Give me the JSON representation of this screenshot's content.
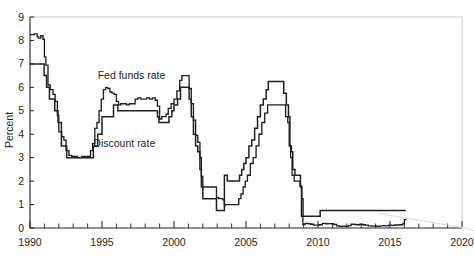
{
  "figure": {
    "background": "#ffffff",
    "ink_color": "#231f20",
    "frame_color": "#c9c9c9",
    "clipped_header_text": ""
  },
  "chart_data": {
    "type": "line",
    "title": "",
    "xlabel": "",
    "ylabel": "Percent",
    "xlim": [
      1990,
      2020
    ],
    "ylim": [
      0,
      9
    ],
    "ytick_labels": [
      "0",
      "1",
      "2",
      "3",
      "4",
      "5",
      "6",
      "7",
      "8",
      "9"
    ],
    "ytick_values": [
      0,
      1,
      2,
      3,
      4,
      5,
      6,
      7,
      8,
      9
    ],
    "xtick_labels": [
      "1990",
      "1995",
      "2000",
      "2005",
      "2010",
      "2015",
      "2020"
    ],
    "xtick_values": [
      1990,
      1995,
      2000,
      2005,
      2010,
      2015,
      2020
    ],
    "xtick_minor_step": 1,
    "grid": false,
    "legend_position": "inline-annotations",
    "annotations": [
      {
        "text": "Fed funds rate",
        "x": 1994.7,
        "y": 6.35
      },
      {
        "text": "Discount rate",
        "x": 1994.4,
        "y": 3.45
      }
    ],
    "series": [
      {
        "name": "Fed funds rate",
        "points": [
          [
            1990.0,
            8.25
          ],
          [
            1990.3,
            8.28
          ],
          [
            1990.5,
            8.15
          ],
          [
            1990.6,
            8.1
          ],
          [
            1990.75,
            8.2
          ],
          [
            1990.9,
            8.05
          ],
          [
            1991.0,
            7.3
          ],
          [
            1991.1,
            6.95
          ],
          [
            1991.25,
            6.1
          ],
          [
            1991.4,
            5.9
          ],
          [
            1991.6,
            5.7
          ],
          [
            1991.75,
            5.4
          ],
          [
            1991.9,
            4.8
          ],
          [
            1992.0,
            4.1
          ],
          [
            1992.2,
            3.9
          ],
          [
            1992.35,
            3.75
          ],
          [
            1992.5,
            3.3
          ],
          [
            1992.7,
            3.1
          ],
          [
            1992.9,
            3.05
          ],
          [
            1993.0,
            3.05
          ],
          [
            1993.3,
            3.0
          ],
          [
            1993.6,
            3.05
          ],
          [
            1993.9,
            3.0
          ],
          [
            1994.0,
            3.05
          ],
          [
            1994.2,
            3.3
          ],
          [
            1994.35,
            3.6
          ],
          [
            1994.5,
            4.25
          ],
          [
            1994.65,
            4.5
          ],
          [
            1994.8,
            5.0
          ],
          [
            1994.95,
            5.5
          ],
          [
            1995.1,
            5.9
          ],
          [
            1995.25,
            6.0
          ],
          [
            1995.4,
            5.95
          ],
          [
            1995.55,
            5.8
          ],
          [
            1995.7,
            5.75
          ],
          [
            1995.85,
            5.7
          ],
          [
            1996.0,
            5.4
          ],
          [
            1996.15,
            5.25
          ],
          [
            1996.3,
            5.3
          ],
          [
            1996.5,
            5.3
          ],
          [
            1996.7,
            5.25
          ],
          [
            1996.9,
            5.3
          ],
          [
            1997.1,
            5.3
          ],
          [
            1997.3,
            5.5
          ],
          [
            1997.5,
            5.55
          ],
          [
            1997.7,
            5.5
          ],
          [
            1997.9,
            5.5
          ],
          [
            1998.1,
            5.55
          ],
          [
            1998.3,
            5.5
          ],
          [
            1998.5,
            5.55
          ],
          [
            1998.7,
            5.45
          ],
          [
            1998.85,
            5.2
          ],
          [
            1999.0,
            4.65
          ],
          [
            1999.15,
            4.75
          ],
          [
            1999.3,
            4.75
          ],
          [
            1999.45,
            4.85
          ],
          [
            1999.6,
            5.1
          ],
          [
            1999.8,
            5.3
          ],
          [
            2000.0,
            5.5
          ],
          [
            2000.2,
            5.85
          ],
          [
            2000.4,
            6.3
          ],
          [
            2000.55,
            6.5
          ],
          [
            2000.75,
            6.5
          ],
          [
            2000.95,
            6.5
          ],
          [
            2001.05,
            5.95
          ],
          [
            2001.2,
            5.3
          ],
          [
            2001.35,
            4.6
          ],
          [
            2001.5,
            3.95
          ],
          [
            2001.65,
            3.65
          ],
          [
            2001.8,
            3.0
          ],
          [
            2001.9,
            2.2
          ],
          [
            2002.0,
            1.75
          ],
          [
            2002.2,
            1.75
          ],
          [
            2002.5,
            1.75
          ],
          [
            2002.8,
            1.75
          ],
          [
            2002.95,
            1.3
          ],
          [
            2003.1,
            1.25
          ],
          [
            2003.25,
            1.25
          ],
          [
            2003.4,
            1.2
          ],
          [
            2003.5,
            0.95
          ],
          [
            2003.55,
            1.0
          ],
          [
            2003.7,
            1.0
          ],
          [
            2004.0,
            1.0
          ],
          [
            2004.3,
            1.0
          ],
          [
            2004.5,
            1.25
          ],
          [
            2004.65,
            1.45
          ],
          [
            2004.8,
            1.75
          ],
          [
            2004.95,
            2.0
          ],
          [
            2005.1,
            2.25
          ],
          [
            2005.3,
            2.75
          ],
          [
            2005.5,
            3.0
          ],
          [
            2005.7,
            3.5
          ],
          [
            2005.9,
            4.0
          ],
          [
            2006.1,
            4.5
          ],
          [
            2006.3,
            4.9
          ],
          [
            2006.5,
            5.25
          ],
          [
            2006.7,
            5.25
          ],
          [
            2007.0,
            5.25
          ],
          [
            2007.3,
            5.25
          ],
          [
            2007.6,
            5.25
          ],
          [
            2007.75,
            4.75
          ],
          [
            2007.9,
            4.5
          ],
          [
            2008.0,
            3.5
          ],
          [
            2008.1,
            3.0
          ],
          [
            2008.2,
            2.25
          ],
          [
            2008.35,
            2.0
          ],
          [
            2008.55,
            2.0
          ],
          [
            2008.75,
            1.8
          ],
          [
            2008.85,
            0.5
          ],
          [
            2008.95,
            0.15
          ],
          [
            2009.1,
            0.2
          ],
          [
            2009.3,
            0.18
          ],
          [
            2009.5,
            0.16
          ],
          [
            2009.7,
            0.12
          ],
          [
            2009.9,
            0.12
          ],
          [
            2010.1,
            0.14
          ],
          [
            2010.3,
            0.2
          ],
          [
            2010.5,
            0.18
          ],
          [
            2010.7,
            0.19
          ],
          [
            2010.9,
            0.18
          ],
          [
            2011.1,
            0.15
          ],
          [
            2011.3,
            0.09
          ],
          [
            2011.5,
            0.07
          ],
          [
            2011.7,
            0.08
          ],
          [
            2011.9,
            0.07
          ],
          [
            2012.1,
            0.1
          ],
          [
            2012.3,
            0.16
          ],
          [
            2012.5,
            0.15
          ],
          [
            2012.7,
            0.14
          ],
          [
            2012.9,
            0.16
          ],
          [
            2013.1,
            0.14
          ],
          [
            2013.3,
            0.12
          ],
          [
            2013.5,
            0.09
          ],
          [
            2013.7,
            0.08
          ],
          [
            2013.9,
            0.09
          ],
          [
            2014.1,
            0.07
          ],
          [
            2014.3,
            0.09
          ],
          [
            2014.5,
            0.1
          ],
          [
            2014.7,
            0.09
          ],
          [
            2014.9,
            0.12
          ],
          [
            2015.1,
            0.11
          ],
          [
            2015.3,
            0.13
          ],
          [
            2015.5,
            0.13
          ],
          [
            2015.7,
            0.14
          ],
          [
            2015.9,
            0.2
          ],
          [
            2016.0,
            0.36
          ],
          [
            2016.1,
            0.37
          ]
        ]
      },
      {
        "name": "Discount rate",
        "points": [
          [
            1990.0,
            7.0
          ],
          [
            1990.5,
            7.0
          ],
          [
            1990.9,
            7.0
          ],
          [
            1990.98,
            6.5
          ],
          [
            1991.1,
            6.5
          ],
          [
            1991.15,
            6.0
          ],
          [
            1991.3,
            6.0
          ],
          [
            1991.35,
            5.5
          ],
          [
            1991.6,
            5.5
          ],
          [
            1991.72,
            5.0
          ],
          [
            1991.9,
            5.0
          ],
          [
            1991.95,
            4.5
          ],
          [
            1992.0,
            4.5
          ],
          [
            1992.18,
            3.5
          ],
          [
            1992.5,
            3.5
          ],
          [
            1992.55,
            3.0
          ],
          [
            1993.0,
            3.0
          ],
          [
            1993.5,
            3.0
          ],
          [
            1994.0,
            3.0
          ],
          [
            1994.35,
            3.0
          ],
          [
            1994.4,
            3.5
          ],
          [
            1994.65,
            3.5
          ],
          [
            1994.7,
            4.0
          ],
          [
            1994.95,
            4.0
          ],
          [
            1995.0,
            4.75
          ],
          [
            1995.3,
            4.75
          ],
          [
            1995.8,
            5.25
          ],
          [
            1996.0,
            5.25
          ],
          [
            1996.1,
            5.0
          ],
          [
            1996.5,
            5.0
          ],
          [
            1997.0,
            5.0
          ],
          [
            1997.5,
            5.0
          ],
          [
            1998.0,
            5.0
          ],
          [
            1998.5,
            5.0
          ],
          [
            1998.8,
            5.0
          ],
          [
            1998.85,
            4.75
          ],
          [
            1998.95,
            4.5
          ],
          [
            1999.3,
            4.5
          ],
          [
            1999.6,
            4.5
          ],
          [
            1999.65,
            4.75
          ],
          [
            1999.85,
            5.0
          ],
          [
            2000.0,
            5.25
          ],
          [
            2000.25,
            5.5
          ],
          [
            2000.45,
            6.0
          ],
          [
            2000.95,
            6.0
          ],
          [
            2001.05,
            5.5
          ],
          [
            2001.2,
            4.75
          ],
          [
            2001.35,
            4.0
          ],
          [
            2001.5,
            3.5
          ],
          [
            2001.65,
            3.25
          ],
          [
            2001.8,
            2.5
          ],
          [
            2001.9,
            1.75
          ],
          [
            2002.0,
            1.25
          ],
          [
            2002.5,
            1.25
          ],
          [
            2002.9,
            1.25
          ],
          [
            2002.95,
            0.75
          ],
          [
            2003.1,
            0.75
          ],
          [
            2003.5,
            2.25
          ],
          [
            2003.7,
            2.0
          ],
          [
            2004.0,
            2.0
          ],
          [
            2004.4,
            2.0
          ],
          [
            2004.55,
            2.25
          ],
          [
            2004.7,
            2.5
          ],
          [
            2004.85,
            2.75
          ],
          [
            2005.0,
            3.0
          ],
          [
            2005.2,
            3.5
          ],
          [
            2005.4,
            3.75
          ],
          [
            2005.6,
            4.25
          ],
          [
            2005.8,
            4.75
          ],
          [
            2006.0,
            5.25
          ],
          [
            2006.2,
            5.5
          ],
          [
            2006.4,
            5.9
          ],
          [
            2006.55,
            6.25
          ],
          [
            2006.8,
            6.25
          ],
          [
            2007.0,
            6.25
          ],
          [
            2007.4,
            6.25
          ],
          [
            2007.62,
            5.75
          ],
          [
            2007.8,
            5.25
          ],
          [
            2007.95,
            4.75
          ],
          [
            2008.05,
            3.5
          ],
          [
            2008.15,
            3.25
          ],
          [
            2008.25,
            2.5
          ],
          [
            2008.4,
            2.25
          ],
          [
            2008.6,
            2.25
          ],
          [
            2008.78,
            1.75
          ],
          [
            2008.88,
            1.25
          ],
          [
            2008.96,
            0.5
          ],
          [
            2009.5,
            0.5
          ],
          [
            2010.0,
            0.5
          ],
          [
            2010.15,
            0.75
          ],
          [
            2010.5,
            0.75
          ],
          [
            2011.0,
            0.75
          ],
          [
            2012.0,
            0.75
          ],
          [
            2013.0,
            0.75
          ],
          [
            2014.0,
            0.75
          ],
          [
            2015.0,
            0.75
          ],
          [
            2015.8,
            0.75
          ],
          [
            2016.1,
            0.75
          ]
        ]
      }
    ]
  }
}
